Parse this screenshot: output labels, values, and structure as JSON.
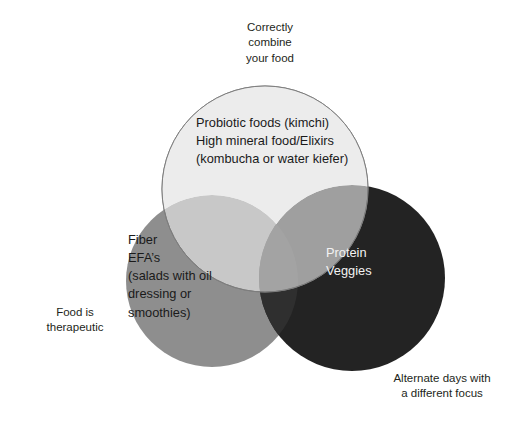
{
  "diagram": {
    "type": "venn-3-circle",
    "background": "#ffffff",
    "circles": [
      {
        "id": "top",
        "name": "correctly-combine-your-food",
        "fill": "#ececec",
        "stroke": "#808080",
        "text": "Probiotic foods (kimchi)\nHigh mineral food/Elixirs\n(kombucha or water kiefer)",
        "text_color": "#1a1a1a",
        "cx": 265,
        "cy": 189,
        "r": 103
      },
      {
        "id": "left",
        "name": "food-is-therapeutic",
        "fill": "#8e8e8e",
        "stroke": "none",
        "text": "Fiber\nEFA’s\n(salads with oil\ndressing or\nsmoothies)",
        "text_color": "#1a1a1a",
        "cx": 212,
        "cy": 281,
        "r": 86
      },
      {
        "id": "right",
        "name": "alternate-days-with-a-different-focus",
        "fill": "#232323",
        "stroke": "none",
        "text": "Protein\nVeggies",
        "text_color": "#f2f2f2",
        "cx": 352,
        "cy": 278,
        "r": 93
      }
    ],
    "labels": [
      {
        "id": "top",
        "name": "label-correctly-combine-your-food",
        "text": "Correctly\ncombine\nyour food"
      },
      {
        "id": "left",
        "name": "label-food-is-therapeutic",
        "text": "Food is\ntherapeutic"
      },
      {
        "id": "right",
        "name": "label-alternate-days",
        "text": "Alternate days with\na different focus"
      }
    ]
  }
}
